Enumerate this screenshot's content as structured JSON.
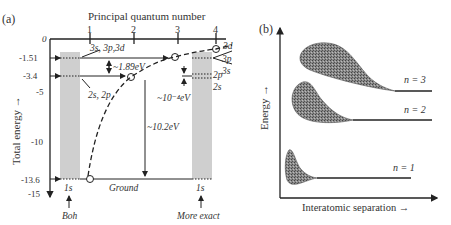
{
  "panel_a": {
    "label": "(a)",
    "top_axis_title": "Principal quantum number",
    "top_ticks": [
      "1",
      "2",
      "3",
      "4"
    ],
    "y_axis_title": "Total energy →",
    "y_ticks": [
      "0",
      "-1.51",
      "-3.4",
      "-5",
      "-10",
      "-13.6",
      "-15"
    ],
    "annotations": {
      "n3_levels": "3s, 3p,3d",
      "n2_levels": "2s, 2p",
      "gap_1_89": "~1.89eV",
      "gap_10_4": "~10⁻⁴eV",
      "gap_10_2": "~10.2eV",
      "ground": "Ground",
      "right_3d": "3d",
      "right_3p": "3p",
      "right_3s": "3s",
      "right_2p": "2p",
      "right_2s": "2s",
      "left_1s": "1s",
      "right_1s": "1s",
      "bohr": "Boh",
      "more_exact": "More exact"
    }
  },
  "panel_b": {
    "label": "(b)",
    "y_axis_title": "Energy →",
    "x_axis_title": "Interatomic separation →",
    "bands": [
      "n = 3",
      "n = 2",
      "n = 1"
    ]
  },
  "colors": {
    "ink": "#222222",
    "band_fill": "#cfcfcf",
    "shade": "#777777"
  }
}
